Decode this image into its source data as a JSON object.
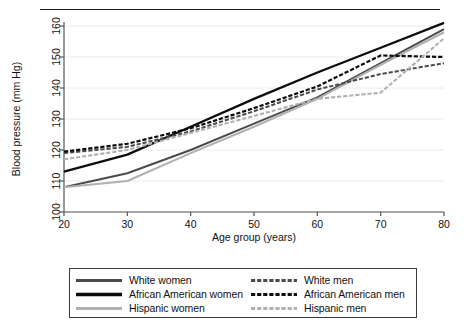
{
  "figure": {
    "top_rule": true
  },
  "chart_data": {
    "type": "line",
    "title": "",
    "xlabel": "Age group (years)",
    "ylabel": "Blood pressure (mm Hg)",
    "x": [
      20,
      30,
      40,
      50,
      60,
      70,
      80
    ],
    "xticks": [
      "20",
      "30",
      "40",
      "50",
      "60",
      "70",
      "80"
    ],
    "yticks": [
      "100",
      "110",
      "120",
      "130",
      "140",
      "150",
      "160"
    ],
    "xlim": [
      20,
      80
    ],
    "ylim": [
      100,
      160
    ],
    "grid": "horizontal",
    "legend_position": "below-plot",
    "legend_columns": 2,
    "series": [
      {
        "name": "White women",
        "color": "#4a4a4a",
        "dash": "solid",
        "width": 1.9,
        "values": [
          108.0,
          112.5,
          120.0,
          128.5,
          137.0,
          148.0,
          159.0
        ]
      },
      {
        "name": "African American women",
        "color": "#0d0d0d",
        "dash": "solid",
        "width": 2.3,
        "values": [
          113.0,
          118.5,
          127.5,
          136.5,
          145.0,
          153.0,
          161.0
        ]
      },
      {
        "name": "Hispanic women",
        "color": "#b0b0b0",
        "dash": "solid",
        "width": 2.1,
        "values": [
          108.0,
          110.0,
          119.0,
          127.5,
          136.5,
          147.5,
          158.0
        ]
      },
      {
        "name": "White men",
        "color": "#4a4a4a",
        "dash": "dashed",
        "width": 2.0,
        "values": [
          119.0,
          121.0,
          126.0,
          132.5,
          139.5,
          144.5,
          148.0
        ]
      },
      {
        "name": "African American men",
        "color": "#0d0d0d",
        "dash": "dashed",
        "width": 2.2,
        "values": [
          119.5,
          122.0,
          127.0,
          133.5,
          140.5,
          150.5,
          150.0
        ]
      },
      {
        "name": "Hispanic men",
        "color": "#b0b0b0",
        "dash": "dashed",
        "width": 2.1,
        "values": [
          117.0,
          120.0,
          125.5,
          131.0,
          136.5,
          138.5,
          156.0
        ]
      }
    ]
  },
  "legend": {
    "rows": [
      {
        "left": "White women",
        "right": "White men"
      },
      {
        "left": "African American women",
        "right": "African American men"
      },
      {
        "left": "Hispanic women",
        "right": "Hispanic men"
      }
    ]
  }
}
